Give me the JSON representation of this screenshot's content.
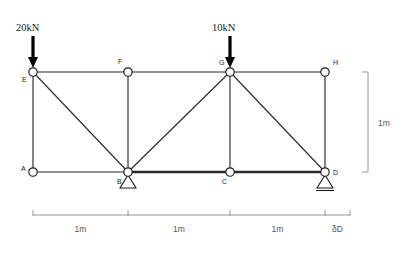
{
  "figure": {
    "type": "structural-truss-diagram"
  },
  "geometry": {
    "top_y": 72,
    "bottom_y": 172,
    "x_positions": [
      33,
      128,
      230,
      325
    ]
  },
  "nodes": [
    {
      "id": "E",
      "label": "E",
      "x": 33,
      "y": 72,
      "label_x": 22,
      "label_y": 82
    },
    {
      "id": "F",
      "label": "F",
      "x": 128,
      "y": 72,
      "label_x": 118,
      "label_y": 64
    },
    {
      "id": "G",
      "label": "G",
      "x": 230,
      "y": 72,
      "label_x": 219,
      "label_y": 65
    },
    {
      "id": "H",
      "label": "H",
      "x": 325,
      "y": 72,
      "label_x": 333,
      "label_y": 65
    },
    {
      "id": "A",
      "label": "A",
      "x": 33,
      "y": 172,
      "label_x": 21,
      "label_y": 171
    },
    {
      "id": "B",
      "label": "B",
      "x": 128,
      "y": 172,
      "label_x": 117,
      "label_y": 184
    },
    {
      "id": "C",
      "label": "C",
      "x": 230,
      "y": 172,
      "label_x": 222,
      "label_y": 184
    },
    {
      "id": "D",
      "label": "D",
      "x": 325,
      "y": 172,
      "label_x": 333,
      "label_y": 175
    }
  ],
  "members": [
    {
      "name": "top-chord-EF",
      "from": "E",
      "to": "F",
      "weight": "normal"
    },
    {
      "name": "top-chord-FG",
      "from": "F",
      "to": "G",
      "weight": "normal"
    },
    {
      "name": "top-chord-GH",
      "from": "G",
      "to": "H",
      "weight": "normal"
    },
    {
      "name": "bottom-chord-AB",
      "from": "A",
      "to": "B",
      "weight": "normal"
    },
    {
      "name": "bottom-chord-BC",
      "from": "B",
      "to": "C",
      "weight": "heavy"
    },
    {
      "name": "bottom-chord-CD",
      "from": "C",
      "to": "D",
      "weight": "heavy"
    },
    {
      "name": "vertical-EA",
      "from": "E",
      "to": "A",
      "weight": "normal"
    },
    {
      "name": "vertical-FB",
      "from": "F",
      "to": "B",
      "weight": "normal"
    },
    {
      "name": "vertical-GC",
      "from": "G",
      "to": "C",
      "weight": "normal"
    },
    {
      "name": "vertical-HD",
      "from": "H",
      "to": "D",
      "weight": "normal"
    },
    {
      "name": "diagonal-EB",
      "from": "E",
      "to": "B",
      "weight": "normal"
    },
    {
      "name": "diagonal-BG",
      "from": "B",
      "to": "G",
      "weight": "normal"
    },
    {
      "name": "diagonal-GD",
      "from": "G",
      "to": "D",
      "weight": "normal"
    }
  ],
  "supports": [
    {
      "name": "support-pin-B",
      "node": "B",
      "kind": "pin",
      "x": 128,
      "y": 172
    },
    {
      "name": "support-roller-D",
      "node": "D",
      "kind": "roller",
      "x": 325,
      "y": 172
    }
  ],
  "loads": [
    {
      "name": "load-at-E",
      "label": "20kN",
      "node": "E",
      "x": 33,
      "tip_y": 68,
      "tail_y": 36,
      "label_x": 16,
      "label_y": 31,
      "direction": "down"
    },
    {
      "name": "load-at-G",
      "label": "10kN",
      "node": "G",
      "x": 230,
      "tip_y": 68,
      "tail_y": 36,
      "label_x": 212,
      "label_y": 31,
      "direction": "down"
    }
  ],
  "dimensions": {
    "horizontal": {
      "baseline_y": 215,
      "tick_height": 5,
      "label_y": 232,
      "segments": [
        {
          "name": "dim-span-1",
          "label": "1m",
          "x_start": 33,
          "x_end": 128
        },
        {
          "name": "dim-span-2",
          "label": "1m",
          "x_start": 128,
          "x_end": 230
        },
        {
          "name": "dim-span-3",
          "label": "1m",
          "x_start": 230,
          "x_end": 325
        },
        {
          "name": "dim-deflection",
          "label": "δD",
          "x_start": 325,
          "x_end": 350
        }
      ]
    },
    "vertical": {
      "name": "dim-height",
      "label": "1m",
      "x": 368,
      "y_top": 72,
      "y_bottom": 172,
      "tick_width": 6,
      "label_x": 378,
      "label_y": 126
    }
  },
  "colors": {
    "member": "#2a2a2a",
    "joint_fill": "#ffffff",
    "load": "#000000",
    "dimension": "#8c8c8c",
    "label": "#1a1a1a",
    "dimension_label": "#555555",
    "background": "#ffffff"
  }
}
